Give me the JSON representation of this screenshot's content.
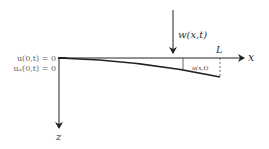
{
  "diagram": {
    "type": "cantilever-beam-deflection",
    "axes": {
      "x_label": "x",
      "z_label": "z"
    },
    "load_label": "w(x,t)",
    "length_label": "L",
    "deflection_label": "u(x,t)",
    "boundary_conditions": [
      "u(0,t) = 0",
      "uₓ(0,t) = 0"
    ],
    "colors": {
      "line": "#222222",
      "text": "#333333",
      "bc_text": "#666666",
      "background": "#ffffff"
    }
  }
}
